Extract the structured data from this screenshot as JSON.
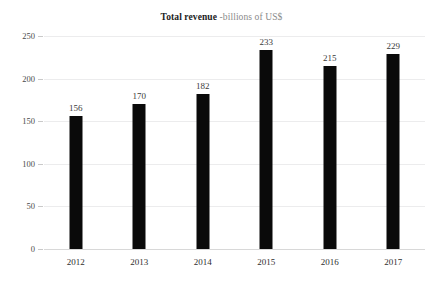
{
  "title": {
    "main": "Total revenue",
    "sub": " -billions of US$"
  },
  "chart_data": {
    "type": "bar",
    "title": "Total revenue -billions of US$",
    "xlabel": "",
    "ylabel": "",
    "categories": [
      "2012",
      "2013",
      "2014",
      "2015",
      "2016",
      "2017"
    ],
    "values": [
      156,
      170,
      182,
      233,
      215,
      229
    ],
    "data_labels": [
      "156",
      "170",
      "182",
      "233",
      "215",
      "229"
    ],
    "ylim": [
      0,
      250
    ],
    "yticks": [
      0,
      50,
      100,
      150,
      200,
      250
    ],
    "ytick_labels": [
      "0",
      "50",
      "100",
      "150",
      "200",
      "250"
    ],
    "grid": true,
    "legend": false,
    "bar_color": "#0a0a0a",
    "background_color": "#ffffff",
    "gridline_color": "#ececed"
  }
}
